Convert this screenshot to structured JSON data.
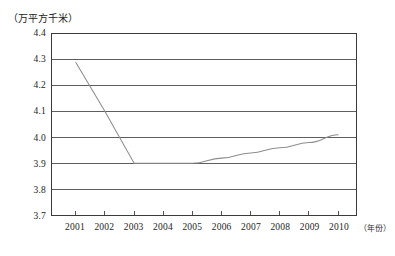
{
  "chart_data": {
    "type": "line",
    "title": "",
    "xlabel": "（年份）",
    "ylabel": "（万平方千米）",
    "x": [
      2001,
      2002,
      2003,
      2004,
      2005,
      2006,
      2007,
      2008,
      2009,
      2010
    ],
    "categories": [
      "2001",
      "2002",
      "2003",
      "2004",
      "2005",
      "2006",
      "2007",
      "2008",
      "2009",
      "2010"
    ],
    "values": [
      4.29,
      4.1,
      3.9,
      3.9,
      3.9,
      3.92,
      3.94,
      3.96,
      3.98,
      4.01
    ],
    "series": [
      {
        "name": "面积",
        "values": [
          4.29,
          4.1,
          3.9,
          3.9,
          3.9,
          3.92,
          3.94,
          3.96,
          3.98,
          4.01
        ]
      }
    ],
    "ylim": [
      3.7,
      4.4
    ],
    "xlim": [
      2001,
      2010
    ],
    "ytick_step": 0.1,
    "yticks": [
      "4.4",
      "4.3",
      "4.2",
      "4.1",
      "4.0",
      "3.9",
      "3.8",
      "3.7"
    ],
    "ytick_values": [
      4.4,
      4.3,
      4.2,
      4.1,
      4.0,
      3.9,
      3.8,
      3.7
    ],
    "xticks": [
      "2001",
      "2002",
      "2003",
      "2004",
      "2005",
      "2006",
      "2007",
      "2008",
      "2009",
      "2010"
    ],
    "grid": "horizontal",
    "legend": "none",
    "line_color": "#8d8d8d",
    "axis_color": "#3b3b3b",
    "background_color": "#ffffff"
  },
  "axes": {
    "y_unit_label": "（万平方千米）",
    "x_unit_label": "（年份）"
  }
}
